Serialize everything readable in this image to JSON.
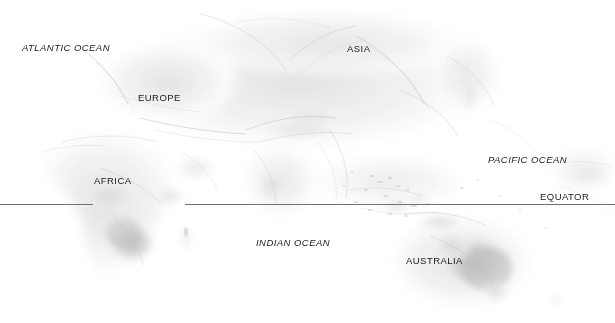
{
  "map": {
    "type": "physical-relief-world-map",
    "projection_note": "equirectangular eastern hemisphere",
    "background_color": "#ffffff",
    "land_tone_light": "#f2f2f2",
    "land_tone_mid": "#d8d8d8",
    "land_tone_dark": "#b4b4b4",
    "reference_line_color": "#6d7278",
    "label_color": "#1a1a1a",
    "labels": [
      {
        "id": "atlantic-ocean",
        "text": "ATLANTIC OCEAN",
        "kind": "ocean",
        "style": "italic",
        "x": 22,
        "y": 43
      },
      {
        "id": "europe",
        "text": "EUROPE",
        "kind": "continent",
        "style": "upright",
        "x": 138,
        "y": 93
      },
      {
        "id": "asia",
        "text": "ASIA",
        "kind": "continent",
        "style": "upright",
        "x": 347,
        "y": 44
      },
      {
        "id": "africa",
        "text": "AFRICA",
        "kind": "continent",
        "style": "upright",
        "x": 94,
        "y": 176
      },
      {
        "id": "pacific-ocean",
        "text": "PACIFIC OCEAN",
        "kind": "ocean",
        "style": "italic",
        "x": 488,
        "y": 155
      },
      {
        "id": "indian-ocean",
        "text": "INDIAN OCEAN",
        "kind": "ocean",
        "style": "italic",
        "x": 256,
        "y": 238
      },
      {
        "id": "australia",
        "text": "AUSTRALIA",
        "kind": "continent",
        "style": "upright",
        "x": 406,
        "y": 256
      },
      {
        "id": "equator",
        "text": "EQUATOR",
        "kind": "reference",
        "style": "upright",
        "x": 540,
        "y": 192
      }
    ],
    "equator": {
      "label": "EQUATOR",
      "y": 204,
      "color": "#6d7278",
      "segments": [
        {
          "x": 0,
          "width": 93
        },
        {
          "x": 185,
          "width": 430
        }
      ]
    }
  }
}
